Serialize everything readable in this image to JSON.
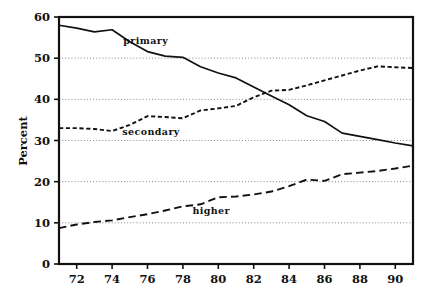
{
  "chart_data": {
    "type": "line",
    "title": "",
    "subtitle": "",
    "xlabel": "",
    "ylabel": "Percent",
    "xlim": [
      71,
      91
    ],
    "ylim": [
      0,
      60
    ],
    "grid": "horizontal-dotted",
    "gridlines_y": [
      10,
      20,
      30,
      40,
      50
    ],
    "legend_position": "inline-annotations",
    "xticks": [
      72,
      74,
      76,
      78,
      80,
      82,
      84,
      86,
      88,
      90
    ],
    "xtick_labels": [
      "72",
      "74",
      "76",
      "78",
      "80",
      "82",
      "84",
      "86",
      "88",
      "90"
    ],
    "yticks": [
      0,
      10,
      20,
      30,
      40,
      50,
      60
    ],
    "ytick_labels": [
      "0",
      "10",
      "20",
      "30",
      "40",
      "50",
      "60"
    ],
    "x": [
      71,
      72,
      73,
      74,
      75,
      76,
      77,
      78,
      79,
      80,
      81,
      82,
      83,
      84,
      85,
      86,
      87,
      88,
      89,
      90,
      91
    ],
    "series": [
      {
        "name": "primary",
        "style": "solid",
        "values": [
          58.0,
          57.3,
          56.4,
          56.9,
          54.0,
          51.6,
          50.5,
          50.2,
          47.9,
          46.4,
          45.2,
          43.0,
          40.8,
          38.7,
          36.0,
          34.6,
          31.8,
          31.0,
          30.2,
          29.4,
          28.7
        ]
      },
      {
        "name": "secondary",
        "style": "short-dash",
        "values": [
          33.0,
          33.0,
          32.8,
          32.3,
          33.8,
          35.9,
          35.7,
          35.4,
          37.3,
          37.8,
          38.4,
          40.5,
          42.1,
          42.3,
          43.4,
          44.6,
          45.8,
          47.0,
          48.0,
          47.8,
          47.6
        ]
      },
      {
        "name": "higher",
        "style": "long-dash",
        "values": [
          8.7,
          9.6,
          10.2,
          10.6,
          11.4,
          12.1,
          13.0,
          14.0,
          14.5,
          16.2,
          16.4,
          16.9,
          17.6,
          18.9,
          20.5,
          20.2,
          21.8,
          22.2,
          22.6,
          23.2,
          23.9
        ]
      }
    ],
    "annotations": [
      {
        "text": "primary",
        "x": 75.9,
        "y": 53.5
      },
      {
        "text": "secondary",
        "x": 76.2,
        "y": 31.3
      },
      {
        "text": "higher",
        "x": 79.6,
        "y": 12.2
      }
    ]
  }
}
